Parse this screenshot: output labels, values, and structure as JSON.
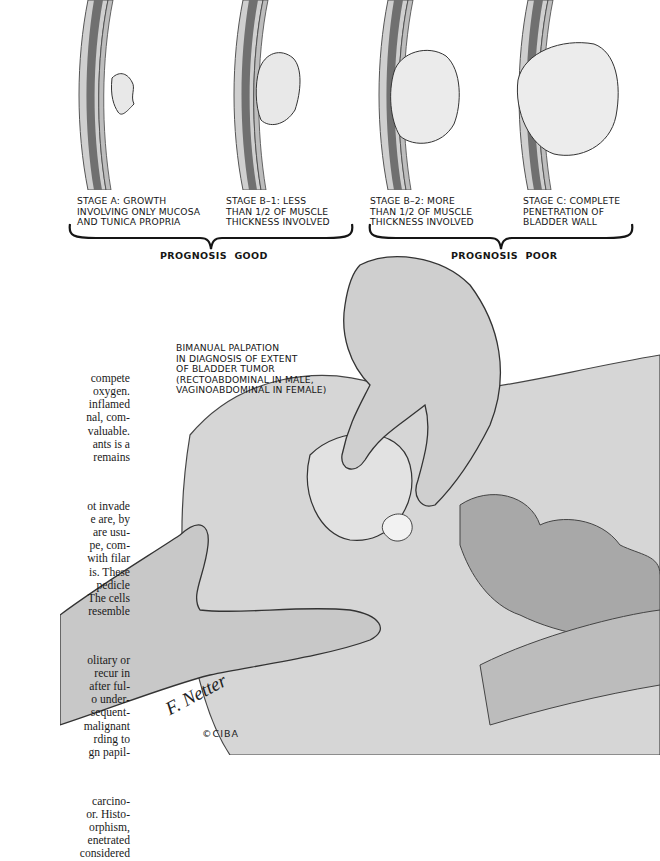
{
  "stages": [
    {
      "id": "stage-a",
      "caption": "STAGE A: GROWTH\nINVOLVING ONLY MUCOSA\nAND TUNICA PROPRIA",
      "tumor_size": "small"
    },
    {
      "id": "stage-b1",
      "caption": "STAGE B–1: LESS\nTHAN 1/2 OF MUSCLE\nTHICKNESS INVOLVED",
      "tumor_size": "medium"
    },
    {
      "id": "stage-b2",
      "caption": "STAGE B–2: MORE\nTHAN 1/2 OF MUSCLE\nTHICKNESS INVOLVED",
      "tumor_size": "large"
    },
    {
      "id": "stage-c",
      "caption": "STAGE C: COMPLETE\nPENETRATION OF\nBLADDER WALL",
      "tumor_size": "very-large"
    }
  ],
  "prognosis": {
    "good": "PROGNOSIS  GOOD",
    "poor": "PROGNOSIS  POOR"
  },
  "palpation_label": "BIMANUAL PALPATION\nIN DIAGNOSIS OF EXTENT\nOF BLADDER TUMOR\n(RECTOABDOMINAL IN MALE,\nVAGINOABDOMINAL IN FEMALE)",
  "body_text": {
    "paragraphs": [
      "compete\noxygen.\ninflamed\nnal, com-\nvaluable.\nants is a\nremains",
      "ot invade\ne are, by\nare usu-\npe, com-\nwith filar\nis. These\npedicle\nThe cells\nresemble",
      "olitary or\nrecur in\nafter ful-\no under-\nsequent-\nmalignant\nrding to\ngn papil-",
      "carcino-\nor. Histo-\norphism,\nenetrated\nconsidered"
    ]
  },
  "signature": {
    "artist": "F. Netter",
    "suffix": "M.D.",
    "copyright": "©CIBA"
  },
  "colors": {
    "ink": "#151515",
    "wall_outer": "#c9c9c9",
    "wall_muscle": "#6f6f6f",
    "tumor": "#e6e6e6",
    "skin": "#bdbdbd"
  }
}
